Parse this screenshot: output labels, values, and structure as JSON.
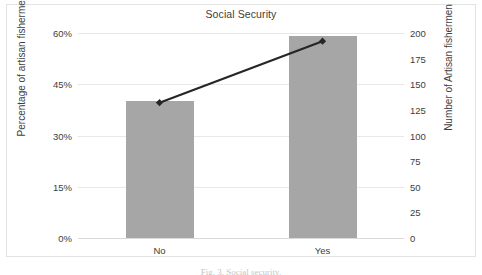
{
  "chart_data": {
    "type": "bar",
    "title": "Social Security",
    "xlabel": "",
    "categories": [
      "No",
      "Yes"
    ],
    "grid": true,
    "legend": "none",
    "bar_series": {
      "name": "Percentage of artisan fishermen",
      "values": [
        40,
        59
      ],
      "value_labels": [
        "40%",
        "59%"
      ],
      "axis": "left",
      "color": "#a6a6a6"
    },
    "line_series": {
      "name": "Number of Artisan fishermen",
      "values": [
        132,
        192
      ],
      "axis": "right",
      "color": "#262626",
      "marker": "diamond"
    },
    "left_axis": {
      "label": "Percentage of artisan fishermen",
      "ticks": [
        "0%",
        "15%",
        "30%",
        "45%",
        "60%"
      ],
      "tick_values": [
        0,
        15,
        30,
        45,
        60
      ],
      "ylim": [
        0,
        60
      ]
    },
    "right_axis": {
      "label": "Number of Artisan fishermen",
      "ticks": [
        "0",
        "25",
        "50",
        "75",
        "100",
        "125",
        "150",
        "175",
        "200"
      ],
      "tick_values": [
        0,
        25,
        50,
        75,
        100,
        125,
        150,
        175,
        200
      ],
      "ylim": [
        0,
        200
      ]
    }
  },
  "caption": "Fig. 3. Social security."
}
